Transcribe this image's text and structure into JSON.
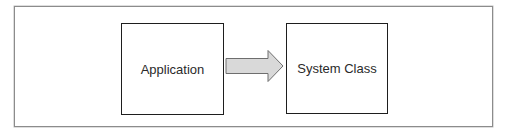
{
  "diagram": {
    "nodes": [
      {
        "id": "application",
        "label": "Application"
      },
      {
        "id": "system-class",
        "label": "System Class"
      }
    ],
    "edges": [
      {
        "from": "application",
        "to": "system-class",
        "style": "block-arrow",
        "fill": "#d9d9d9",
        "stroke": "#6e6e6e"
      }
    ],
    "colors": {
      "frame_border": "#8c8c8c",
      "box_border": "#1e1e1e",
      "arrow_fill": "#d9d9d9",
      "arrow_stroke": "#6e6e6e",
      "text": "#2a2a2a"
    }
  }
}
